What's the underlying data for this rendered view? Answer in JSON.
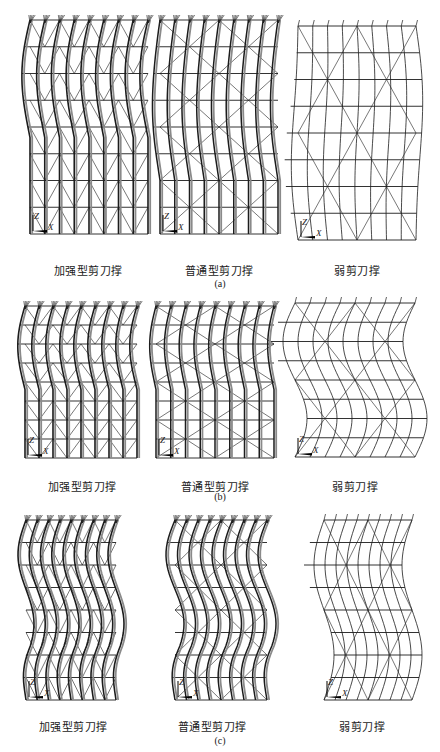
{
  "figure": {
    "rows": [
      {
        "label": "(a)",
        "panels": [
          {
            "caption": "加强型剪刀撑",
            "type": "reinforced",
            "x": 30,
            "y": 14,
            "w": 118,
            "h": 222,
            "amp": 9,
            "mode": "top-bulge",
            "cols": 9,
            "rows": 8
          },
          {
            "caption": "普通型剪刀撑",
            "type": "ordinary",
            "x": 160,
            "y": 14,
            "w": 118,
            "h": 222,
            "amp": 10,
            "mode": "top-s",
            "cols": 9,
            "rows": 8
          },
          {
            "caption": "弱剪刀撑",
            "type": "weak",
            "x": 298,
            "y": 20,
            "w": 118,
            "h": 222,
            "amp": 7,
            "mode": "global-s",
            "cols": 9,
            "rows": 8
          }
        ]
      },
      {
        "label": "(b)",
        "panels": [
          {
            "caption": "加强型剪刀撑",
            "type": "reinforced",
            "x": 25,
            "y": 300,
            "w": 112,
            "h": 160,
            "amp": 8,
            "mode": "top-bulge",
            "cols": 9,
            "rows": 8
          },
          {
            "caption": "普通型剪刀撑",
            "type": "ordinary",
            "x": 156,
            "y": 300,
            "w": 118,
            "h": 160,
            "amp": 7,
            "mode": "top-bulge",
            "cols": 9,
            "rows": 8
          },
          {
            "caption": "弱剪刀撑",
            "type": "weak",
            "x": 295,
            "y": 297,
            "w": 120,
            "h": 162,
            "amp": 12,
            "mode": "double-wave",
            "cols": 9,
            "rows": 8
          }
        ]
      },
      {
        "label": "(c)",
        "panels": [
          {
            "caption": "加强型剪刀撑",
            "type": "reinforced",
            "x": 26,
            "y": 514,
            "w": 90,
            "h": 188,
            "amp": 8,
            "mode": "multi-wave",
            "cols": 9,
            "rows": 8
          },
          {
            "caption": "普通型剪刀撑",
            "type": "ordinary",
            "x": 175,
            "y": 514,
            "w": 92,
            "h": 188,
            "amp": 9,
            "mode": "multi-wave",
            "cols": 9,
            "rows": 8
          },
          {
            "caption": "弱剪刀撑",
            "type": "weak",
            "x": 324,
            "y": 514,
            "w": 88,
            "h": 188,
            "amp": 10,
            "mode": "double-wave",
            "cols": 9,
            "rows": 8
          }
        ]
      }
    ],
    "captions_pos": [
      {
        "row": 0,
        "y": 262,
        "xs": [
          88,
          219,
          357
        ],
        "label_y": 278
      },
      {
        "row": 1,
        "y": 478,
        "xs": [
          82,
          215,
          355
        ],
        "label_y": 491
      },
      {
        "row": 2,
        "y": 718,
        "xs": [
          73,
          212,
          362
        ],
        "label_y": 735
      }
    ],
    "axis": {
      "vertical": "Z",
      "horizontal": "X"
    },
    "line_color": "#1c1c1c",
    "shade_color": "#8a8a8a"
  }
}
